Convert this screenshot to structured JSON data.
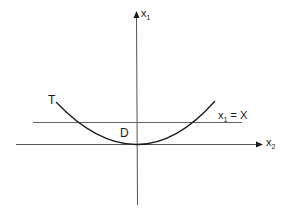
{
  "diagram": {
    "axes": {
      "vertical": {
        "label_main": "x",
        "label_sub": "1"
      },
      "horizontal": {
        "label_main": "x",
        "label_sub": "2"
      }
    },
    "curve": {
      "label": "T"
    },
    "region": {
      "label": "D"
    },
    "level_line": {
      "label_main": "x",
      "label_sub": "1",
      "label_rest": " = X"
    },
    "colors": {
      "ink": "#1a1a1a",
      "line": "#555555",
      "background": "#ffffff"
    }
  }
}
